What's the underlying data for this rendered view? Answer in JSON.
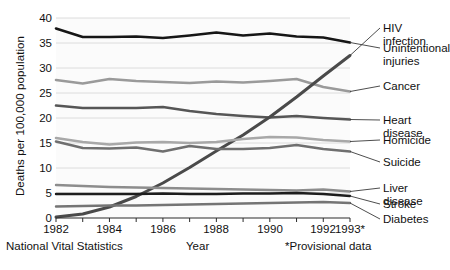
{
  "chart_data": {
    "type": "line",
    "title": "",
    "xlabel": "Year",
    "ylabel": "Deaths per 100,000 population",
    "xlim": [
      1982,
      1993
    ],
    "ylim": [
      0,
      40
    ],
    "yticks": [
      0,
      5,
      10,
      15,
      20,
      25,
      30,
      35,
      40
    ],
    "xticks": [
      "1982",
      "1983",
      "1984",
      "1985",
      "1986",
      "1987",
      "1988",
      "1989",
      "1990",
      "1991",
      "1992",
      "1993*"
    ],
    "xtick_labels_shown": [
      "1982",
      "1984",
      "1986",
      "1988",
      "1990",
      "1992",
      "1993*"
    ],
    "grid": "horizontal",
    "legend_position": "right-callout",
    "x": [
      1982,
      1983,
      1984,
      1985,
      1986,
      1987,
      1988,
      1989,
      1990,
      1991,
      1992,
      1993
    ],
    "series": [
      {
        "name": "Unintentional injuries",
        "color": "#161616",
        "width": 2.6,
        "values": [
          37.9,
          36.2,
          36.2,
          36.3,
          36.0,
          36.5,
          37.1,
          36.5,
          36.9,
          36.3,
          36.1,
          35.1
        ]
      },
      {
        "name": "Cancer",
        "color": "#9a9a9a",
        "width": 2.6,
        "values": [
          27.6,
          26.9,
          27.8,
          27.4,
          27.2,
          27.0,
          27.3,
          27.1,
          27.4,
          27.8,
          26.2,
          25.3
        ]
      },
      {
        "name": "Heart disease",
        "color": "#565656",
        "width": 2.6,
        "values": [
          22.5,
          22.0,
          22.0,
          22.0,
          22.2,
          21.4,
          20.8,
          20.4,
          20.1,
          20.4,
          20.0,
          19.7
        ]
      },
      {
        "name": "HIV infection",
        "color": "#4a4a4a",
        "width": 3.0,
        "values": [
          0.2,
          0.8,
          2.2,
          4.3,
          7.0,
          10.1,
          13.4,
          16.6,
          20.2,
          24.2,
          28.4,
          32.5
        ]
      },
      {
        "name": "Homicide",
        "color": "#a8a8a8",
        "width": 2.6,
        "values": [
          16.0,
          15.2,
          14.7,
          15.1,
          15.2,
          15.0,
          15.2,
          15.8,
          16.2,
          16.1,
          15.6,
          15.3
        ]
      },
      {
        "name": "Suicide",
        "color": "#6f6f6f",
        "width": 2.6,
        "values": [
          15.3,
          14.0,
          13.9,
          14.1,
          13.3,
          14.4,
          13.8,
          13.8,
          14.0,
          14.6,
          13.8,
          13.3
        ]
      },
      {
        "name": "Liver disease",
        "color": "#8d8d8d",
        "width": 2.4,
        "values": [
          6.6,
          6.4,
          6.2,
          6.1,
          6.0,
          5.9,
          5.8,
          5.7,
          5.6,
          5.5,
          5.7,
          5.3
        ]
      },
      {
        "name": "Stroke",
        "color": "#1d1d1d",
        "width": 2.4,
        "values": [
          4.8,
          4.8,
          4.8,
          4.8,
          4.9,
          4.8,
          4.8,
          4.9,
          4.9,
          5.0,
          4.8,
          4.4
        ]
      },
      {
        "name": "Diabetes",
        "color": "#747474",
        "width": 2.4,
        "values": [
          2.3,
          2.4,
          2.5,
          2.5,
          2.6,
          2.7,
          2.8,
          2.9,
          3.0,
          3.1,
          3.2,
          3.0
        ]
      }
    ],
    "callouts": [
      {
        "name": "HIV infection",
        "label": "HIV infection"
      },
      {
        "name": "Unintentional injuries",
        "label": "Unintentional\ninjuries"
      },
      {
        "name": "Cancer",
        "label": "Cancer"
      },
      {
        "name": "Heart disease",
        "label": "Heart disease"
      },
      {
        "name": "Homicide",
        "label": "Homicide"
      },
      {
        "name": "Suicide",
        "label": "Suicide"
      },
      {
        "name": "Liver disease",
        "label": "Liver disease"
      },
      {
        "name": "Stroke",
        "label": "Stroke"
      },
      {
        "name": "Diabetes",
        "label": "Diabetes"
      }
    ]
  },
  "axis": {
    "ylabel": "Deaths per 100,000 population",
    "xlabel": "Year",
    "yticks": [
      "40",
      "35",
      "30",
      "25",
      "20",
      "15",
      "10",
      "5",
      "0"
    ],
    "xticks": [
      "1982",
      "1984",
      "1986",
      "1988",
      "1990",
      "1992",
      "1993*"
    ]
  },
  "labels": {
    "hiv": "HIV infection",
    "unintentional": "Unintentional\ninjuries",
    "cancer": "Cancer",
    "heart": "Heart disease",
    "homicide": "Homicide",
    "suicide": "Suicide",
    "liver": "Liver disease",
    "stroke": "Stroke",
    "diabetes": "Diabetes"
  },
  "footer": {
    "source": "National Vital Statistics",
    "xlabel": "Year",
    "note": "*Provisional data"
  },
  "colors": {
    "background": "#ffffff",
    "plot_background": "#fbfbfb",
    "grid": "#d8d8d8",
    "axis": "#2b2b2b",
    "text": "#111111"
  }
}
